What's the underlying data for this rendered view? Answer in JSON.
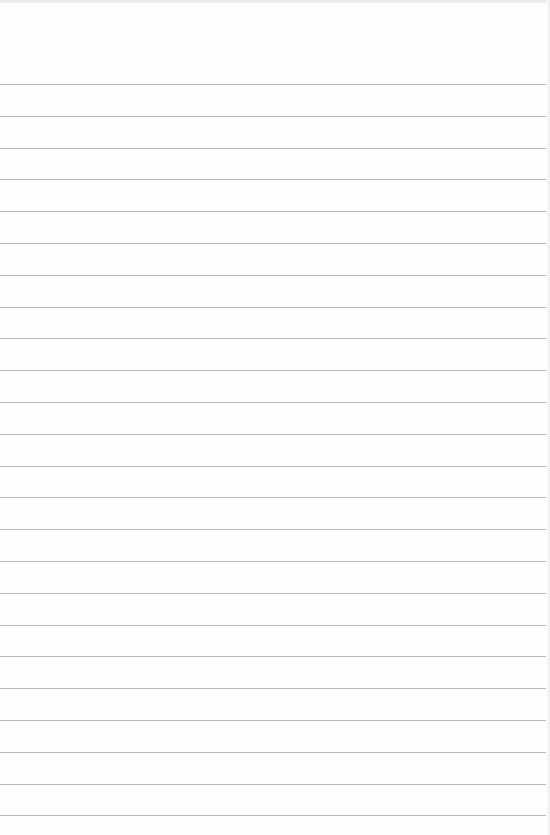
{
  "notepad": {
    "paper_color": "#fefefe",
    "rule_color": "#a9a9a9",
    "first_rule_y": 84,
    "rule_spacing": 31.8,
    "rule_count": 24,
    "text": ""
  }
}
